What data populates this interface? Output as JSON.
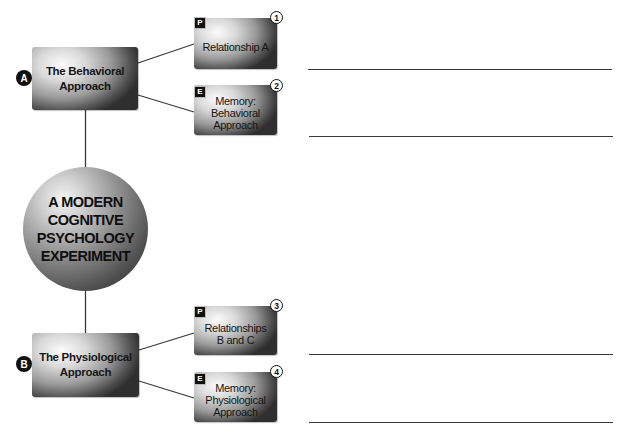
{
  "center": {
    "label": "A MODERN\nCOGNITIVE\nPSYCHOLOGY\nEXPERIMENT"
  },
  "approaches": [
    {
      "badge": "A",
      "label": "The Behavioral\nApproach",
      "items": [
        {
          "type": "P",
          "number": "1",
          "label": "Relationship A"
        },
        {
          "type": "E",
          "number": "2",
          "label": "Memory:\nBehavioral\nApproach"
        }
      ]
    },
    {
      "badge": "B",
      "label": "The Physiological\nApproach",
      "items": [
        {
          "type": "P",
          "number": "3",
          "label": "Relationships\nB and C"
        },
        {
          "type": "E",
          "number": "4",
          "label": "Memory:\nPhysiological\nApproach"
        }
      ]
    }
  ],
  "answer_lines": 4,
  "colors": {
    "line": "#3a3a3a",
    "badge": "#111111",
    "text": "#161616"
  }
}
